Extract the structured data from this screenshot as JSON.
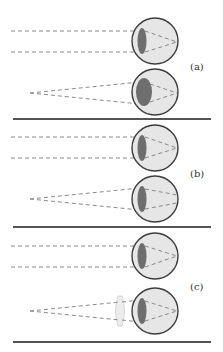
{
  "figure": {
    "panels": [
      {
        "label": "(a)",
        "description": "Normal eye accommodating: distant (parallel rays) with thin lens, near point source with thick lens",
        "eyes": [
          {
            "source": "distant",
            "lens": "thin"
          },
          {
            "source": "near",
            "lens": "thick"
          }
        ]
      },
      {
        "label": "(b)",
        "description": "Eye unable to accommodate: lens remains thin for near source",
        "eyes": [
          {
            "source": "distant",
            "lens": "thin"
          },
          {
            "source": "near",
            "lens": "thin"
          }
        ]
      },
      {
        "label": "(c)",
        "description": "Corrected with external converging lens for near source",
        "eyes": [
          {
            "source": "distant",
            "lens": "thin"
          },
          {
            "source": "near",
            "lens": "thin",
            "corrective_lens": true
          }
        ]
      }
    ],
    "colors": {
      "eyeball_fill": "#e6e6e6",
      "eyeball_stroke": "#3c3c3c",
      "lens_fill": "#6e6e6e",
      "ray": "#8a8a8a",
      "separator": "#555555",
      "corrective_lens": "#ececec"
    }
  }
}
